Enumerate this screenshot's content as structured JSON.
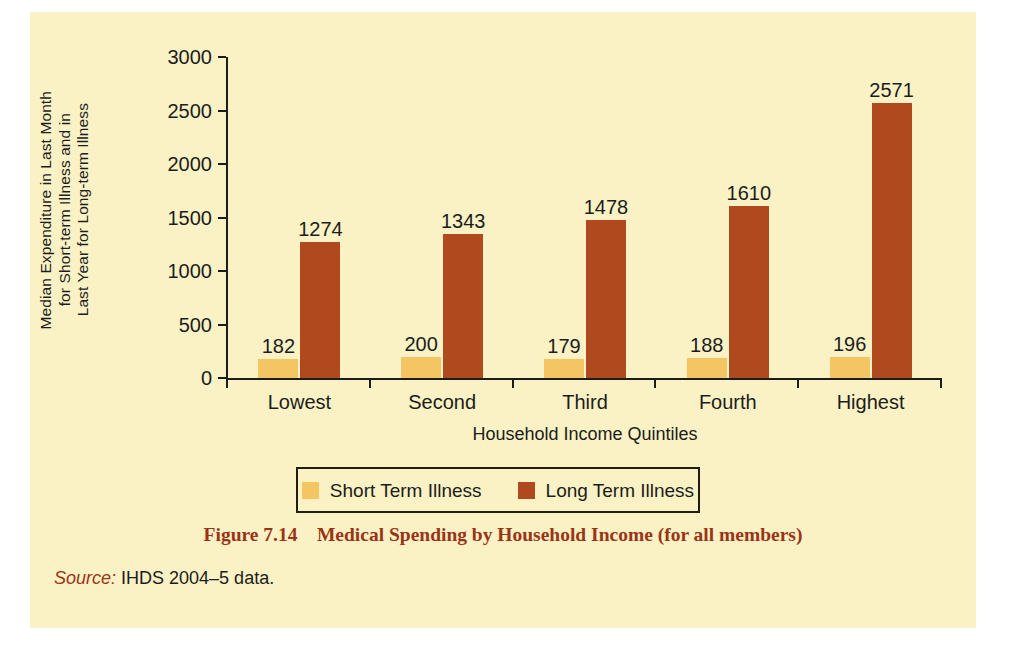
{
  "figure": {
    "caption_number": "Figure 7.14",
    "caption_text": "Medical Spending by Household Income (for all members)",
    "caption_full": "Figure 7.14    Medical Spending by Household Income (for all members)",
    "source_word": "Source:",
    "source_text": " IHDS 2004–5 data."
  },
  "colors": {
    "panel_background": "#faf2c4",
    "page_background": "#ffffff",
    "short_term": "#f3c563",
    "long_term": "#b04a1e",
    "axis": "#1c1c1c",
    "caption": "#9a3418",
    "legend_border": "#211d10"
  },
  "chart_data": {
    "type": "bar",
    "title": "Medical Spending by Household Income (for all members)",
    "xlabel": "Household Income Quintiles",
    "ylabel": "Median Expenditure in Last Month for Short-term Illness and in Last Year for Long-term Illness",
    "ylabel_lines": [
      "Median Expenditure in Last Month",
      "for Short-term Illness and in",
      "Last Year for Long-term Illness"
    ],
    "categories": [
      "Lowest",
      "Second",
      "Third",
      "Fourth",
      "Highest"
    ],
    "series": [
      {
        "name": "Short Term Illness",
        "color": "#f3c563",
        "values": [
          182,
          200,
          179,
          188,
          196
        ]
      },
      {
        "name": "Long Term Illness",
        "color": "#b04a1e",
        "values": [
          1274,
          1343,
          1478,
          1610,
          2571
        ]
      }
    ],
    "ylim": [
      0,
      3000
    ],
    "ytick_values": [
      0,
      500,
      1000,
      1500,
      2000,
      2500,
      3000
    ],
    "ytick_labels": [
      "0",
      "500",
      "1000",
      "1500",
      "2000",
      "2500",
      "3000"
    ],
    "grid": false,
    "legend_position": "below-axis-centered",
    "data_labels": true
  },
  "legend": {
    "items": [
      {
        "label": "Short Term Illness",
        "color": "#f3c563"
      },
      {
        "label": "Long Term Illness",
        "color": "#b04a1e"
      }
    ]
  }
}
